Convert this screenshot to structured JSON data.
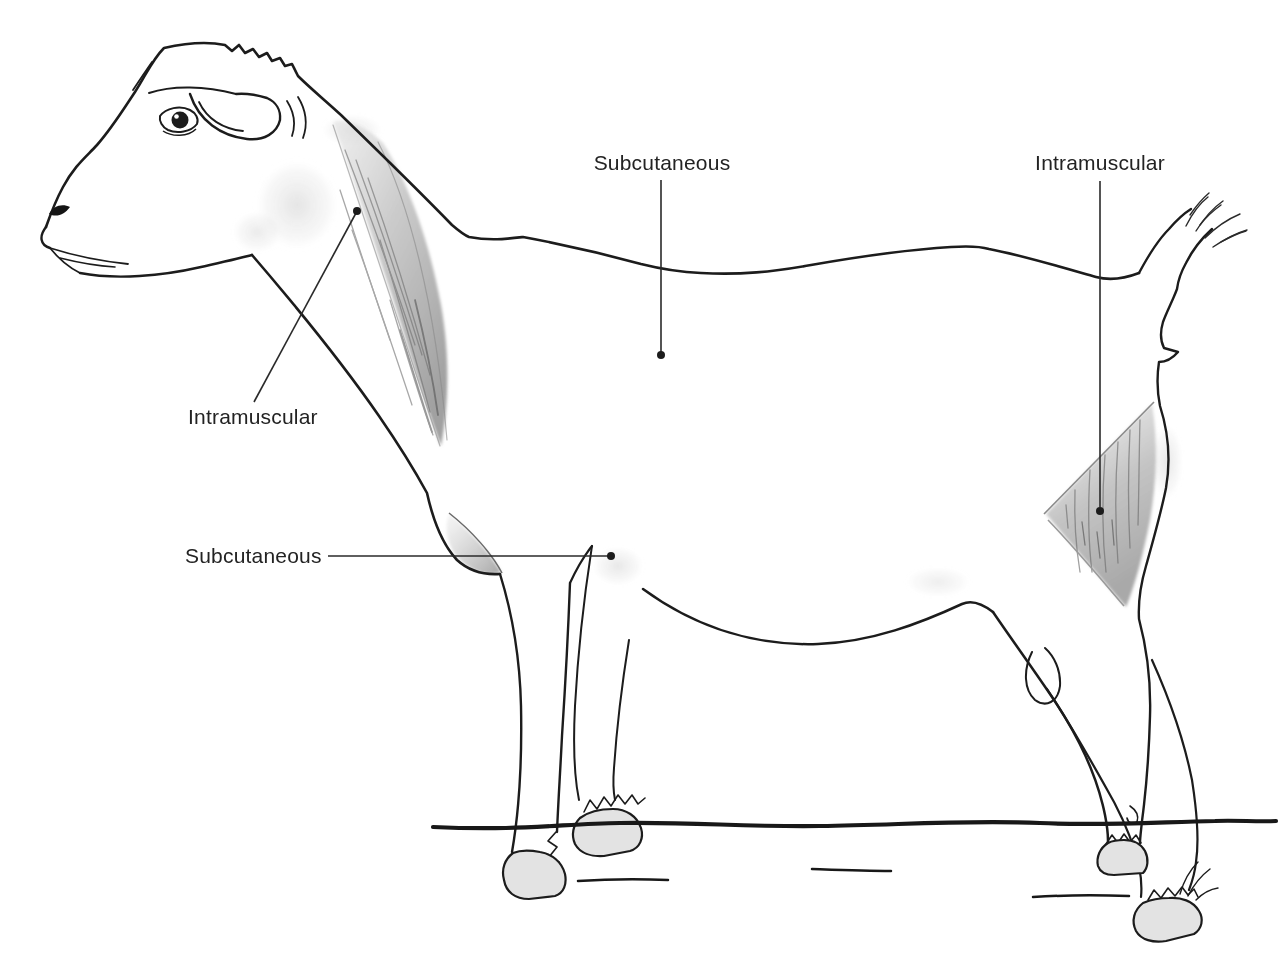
{
  "diagram": {
    "labels": {
      "subcutaneous_top": "Subcutaneous",
      "intramuscular_thigh": "Intramuscular",
      "intramuscular_neck": "Intramuscular",
      "subcutaneous_elbow": "Subcutaneous"
    },
    "colors": {
      "background": "#ffffff",
      "outline": "#1c1c1c",
      "label_text": "#232323",
      "muscle_shading": "#a8a8a8"
    }
  }
}
